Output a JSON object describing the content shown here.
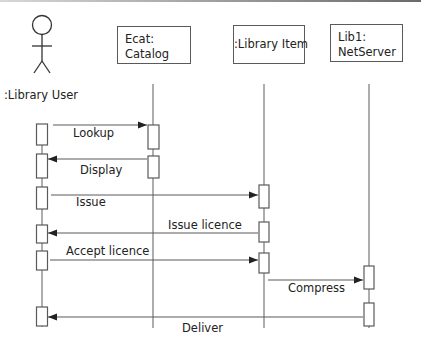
{
  "diagram": {
    "type": "UML sequence diagram",
    "colors": {
      "line": "#5a5a5a",
      "text": "#222222",
      "background": "#ffffff"
    },
    "actor": {
      "label": ":Library User"
    },
    "objects": [
      {
        "id": "ecat",
        "line1": "Ecat:",
        "line2": "Catalog"
      },
      {
        "id": "item",
        "label": ":Library Item"
      },
      {
        "id": "server",
        "line1": "Lib1:",
        "line2": "NetServer"
      }
    ],
    "messages": [
      {
        "label": "Lookup",
        "from": ":Library User",
        "to": "Ecat: Catalog",
        "direction": "right"
      },
      {
        "label": "Display",
        "from": "Ecat: Catalog",
        "to": ":Library User",
        "direction": "left"
      },
      {
        "label": "Issue",
        "from": ":Library User",
        "to": ":Library Item",
        "direction": "right"
      },
      {
        "label": "Issue licence",
        "from": ":Library Item",
        "to": ":Library User",
        "direction": "left"
      },
      {
        "label": "Accept licence",
        "from": ":Library User",
        "to": ":Library Item",
        "direction": "right"
      },
      {
        "label": "Compress",
        "from": ":Library Item",
        "to": "Lib1: NetServer",
        "direction": "right"
      },
      {
        "label": "Deliver",
        "from": "Lib1: NetServer",
        "to": ":Library User",
        "direction": "left"
      }
    ]
  }
}
